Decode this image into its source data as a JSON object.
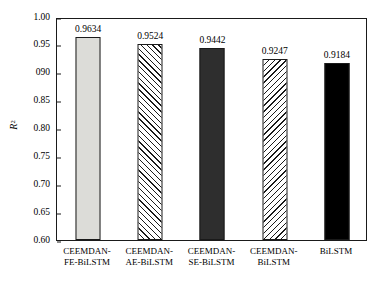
{
  "chart_data": {
    "type": "bar",
    "title": "",
    "subtitle": "",
    "xlabel": "",
    "ylabel": "R²",
    "ylabel_base": "R",
    "ylabel_sup": "2",
    "ylim": [
      0.6,
      1.0
    ],
    "yticks": [
      1.0,
      0.95,
      0.9,
      0.85,
      0.8,
      0.75,
      0.7,
      0.65,
      0.6
    ],
    "ytick_labels": [
      "1.00",
      "0.95",
      "090",
      "0.85",
      "0.80",
      "0.75",
      "0.70",
      "0.65",
      "0.60"
    ],
    "grid": false,
    "legend": "none",
    "categories": [
      "CEEMDAN-FE-BiLSTM",
      "CEEMDAN-AE-BiLSTM",
      "CEEMDAN-SE-BiLSTM",
      "CEEMDAN-BiLSTM",
      "BiLSTM"
    ],
    "category_lines": [
      [
        "CEEMDAN-",
        "FE-BiLSTM"
      ],
      [
        "CEEMDAN-",
        "AE-BiLSTM"
      ],
      [
        "CEEMDAN-",
        "SE-BiLSTM"
      ],
      [
        "CEEMDAN-",
        "BiLSTM"
      ],
      [
        "BiLSTM",
        ""
      ]
    ],
    "values": [
      0.9634,
      0.9524,
      0.9442,
      0.9247,
      0.9184
    ],
    "value_labels": [
      "0.9634",
      "0.9524",
      "0.9442",
      "0.9247",
      "0.9184"
    ],
    "bar_styles": [
      "solid-light-gray",
      "diagonal-hatch-forward",
      "solid-dark-gray",
      "diagonal-hatch-backward",
      "solid-black"
    ],
    "bar_colors": [
      "#dcdcd8",
      "#ffffff",
      "#2e2e2e",
      "#ffffff",
      "#000000"
    ],
    "edge_color": "#1a1a1a",
    "background_color": "#ffffff"
  }
}
